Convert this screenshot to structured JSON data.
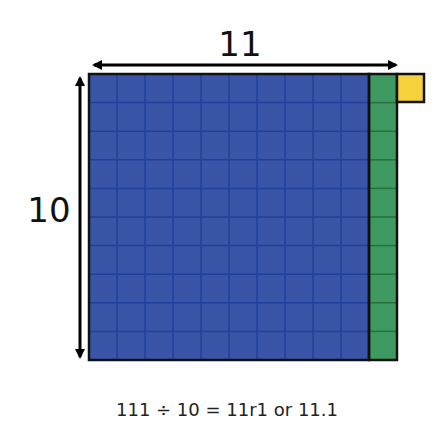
{
  "diagram": {
    "width_label": "11",
    "height_label": "10",
    "equation": "111 ÷ 10 = 11r1 or 11.1",
    "grid": {
      "blue_columns": 10,
      "rows": 10,
      "green_columns": 1,
      "yellow_squares": 1
    },
    "colors": {
      "blue": "#3a55a8",
      "blue_grid": "#1d3f9a",
      "green": "#3f9a62",
      "green_grid": "#2a6e44",
      "yellow": "#f5d23c",
      "outline": "#111111",
      "arrow": "#000000"
    }
  }
}
